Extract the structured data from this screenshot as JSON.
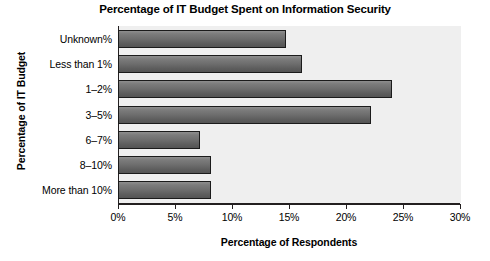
{
  "chart_data": {
    "type": "bar",
    "orientation": "horizontal",
    "title": "Percentage of IT Budget Spent on Information Security",
    "xlabel": "Percentage of Respondents",
    "ylabel": "Percentage of IT Budget",
    "categories": [
      "Unknown%",
      "Less than 1%",
      "1–2%",
      "3–5%",
      "6–7%",
      "8–10%",
      "More than 10%"
    ],
    "values": [
      14.7,
      16.1,
      24.0,
      22.2,
      7.2,
      8.2,
      8.2
    ],
    "xlim": [
      0,
      30
    ],
    "xticks": [
      0,
      5,
      10,
      15,
      20,
      25,
      30
    ],
    "xtick_labels": [
      "0%",
      "5%",
      "10%",
      "15%",
      "20%",
      "25%",
      "30%"
    ],
    "grid": false,
    "legend": false,
    "value_unit": "%",
    "colors": {
      "bar_top": "#8e8e8e",
      "bar_bottom": "#545454",
      "bar_outline": "#1b1b1b",
      "plot_background": "#efefef",
      "axis": "#231f20",
      "text": "#000000",
      "page_background": "#ffffff"
    }
  }
}
